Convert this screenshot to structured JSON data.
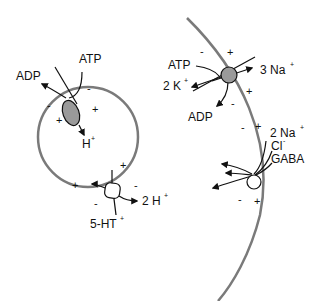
{
  "diagram": {
    "type": "membrane transport schematic",
    "colors": {
      "membrane": "#7a7a7a",
      "pump_fill": "#9a9a9a",
      "transporter_fill": "#ffffff",
      "line": "#111111"
    },
    "vesicle": {
      "v_atpase": {
        "inputs": [
          "ATP"
        ],
        "outputs": [
          "ADP",
          "H"
        ],
        "labels": {
          "atp": "ATP",
          "adp": "ADP",
          "h": "H",
          "h_charge": "+"
        }
      },
      "vmat": {
        "labels": {
          "h2": "2 H",
          "h2_charge": "+",
          "serotonin": "5-HT",
          "serotonin_charge": "+"
        }
      },
      "signs": {
        "pump_outer_left": "-",
        "pump_outer_right": "-",
        "pump_inner_left": "+",
        "pump_inner_right": "+",
        "vmat_inner_top": "+",
        "vmat_inner_left": "+",
        "vmat_outer_right": "-",
        "vmat_outer_bottom": "-"
      }
    },
    "plasma_membrane": {
      "na_k_atpase": {
        "labels": {
          "atp": "ATP",
          "adp": "ADP",
          "k": "2 K",
          "k_charge": "+",
          "na": "3 Na",
          "na_charge": "+"
        }
      },
      "gaba_transporter": {
        "labels": {
          "na": "2 Na",
          "na_charge": "+",
          "cl": "Cl",
          "cl_charge": "-",
          "gaba": "GABA"
        }
      },
      "signs": {
        "pump_in_top": "-",
        "pump_out_top": "+",
        "pump_out_bottom": "+",
        "pump_in_bottom": "-",
        "gat_in_top": "-",
        "gat_out_top": "+",
        "gat_in_bottom": "-",
        "gat_out_bottom": "+"
      }
    }
  }
}
